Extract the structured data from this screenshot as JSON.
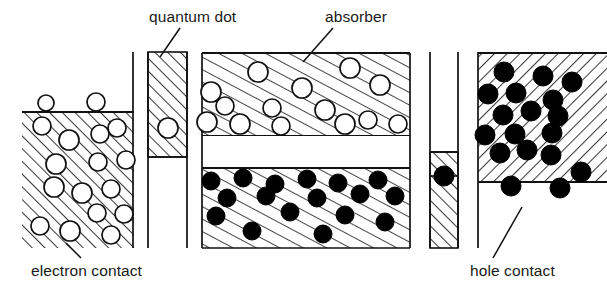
{
  "figure": {
    "kind": "semiconductor-band-diagram",
    "width": 607,
    "height": 293,
    "background_color": "#ffffff",
    "line_color": "#1a1a1a",
    "hatch_color": "#4a4a4a",
    "electron_fill": "#ffffff",
    "hole_fill": "#000000"
  },
  "labels": {
    "quantum_dot": "quantum dot",
    "absorber": "absorber",
    "electron_contact": "electron contact",
    "hole_contact": "hole contact"
  },
  "regions": [
    {
      "name": "electron-contact",
      "label": "electron contact",
      "hatch_direction": "up-right",
      "carrier": "electron",
      "carrier_symbol": "open-circle",
      "x": 22,
      "y": 112,
      "width": 112,
      "height": 136
    },
    {
      "name": "quantum-dot-barrier-left",
      "label": "quantum dot",
      "hatch_direction": "up-right",
      "carrier": "electron",
      "carrier_symbol": "open-circle",
      "x": 148,
      "y": 52,
      "width": 39,
      "height": 105
    },
    {
      "name": "absorber-conduction-band",
      "label": "absorber",
      "hatch_direction": "up-right",
      "carrier": "electron",
      "carrier_symbol": "open-circle",
      "x": 202,
      "y": 53,
      "width": 208,
      "height": 83
    },
    {
      "name": "absorber-bandgap",
      "label": "bandgap",
      "hatch_direction": "none",
      "carrier": "none",
      "x": 202,
      "y": 136,
      "width": 208,
      "height": 32
    },
    {
      "name": "absorber-valence-band",
      "label": "absorber",
      "hatch_direction": "up-right",
      "carrier": "hole",
      "carrier_symbol": "filled-circle",
      "x": 202,
      "y": 168,
      "width": 208,
      "height": 80
    },
    {
      "name": "quantum-dot-barrier-right",
      "label": "quantum dot",
      "hatch_direction": "up-right",
      "carrier": "hole",
      "carrier_symbol": "filled-circle",
      "x": 430,
      "y": 152,
      "width": 28,
      "height": 96
    },
    {
      "name": "hole-contact",
      "label": "hole contact",
      "hatch_direction": "down-right",
      "carrier": "hole",
      "carrier_symbol": "filled-circle",
      "x": 478,
      "y": 53,
      "width": 129,
      "height": 129
    }
  ],
  "carriers": {
    "electrons_free_above_contact": [
      {
        "cx": 46,
        "cy": 103,
        "r": 8
      },
      {
        "cx": 96,
        "cy": 102,
        "r": 9
      }
    ],
    "electrons_in_contact": [
      {
        "cx": 42,
        "cy": 126,
        "r": 9
      },
      {
        "cx": 69,
        "cy": 140,
        "r": 10
      },
      {
        "cx": 100,
        "cy": 134,
        "r": 9
      },
      {
        "cx": 117,
        "cy": 128,
        "r": 9
      },
      {
        "cx": 56,
        "cy": 164,
        "r": 10
      },
      {
        "cx": 98,
        "cy": 162,
        "r": 9
      },
      {
        "cx": 126,
        "cy": 160,
        "r": 9
      },
      {
        "cx": 54,
        "cy": 187,
        "r": 10
      },
      {
        "cx": 82,
        "cy": 193,
        "r": 10
      },
      {
        "cx": 111,
        "cy": 189,
        "r": 9
      },
      {
        "cx": 97,
        "cy": 213,
        "r": 9
      },
      {
        "cx": 124,
        "cy": 214,
        "r": 9
      },
      {
        "cx": 40,
        "cy": 226,
        "r": 9
      },
      {
        "cx": 70,
        "cy": 231,
        "r": 10
      },
      {
        "cx": 111,
        "cy": 235,
        "r": 9
      }
    ],
    "electron_in_quantum_dot_left": [
      {
        "cx": 168,
        "cy": 128,
        "r": 10
      }
    ],
    "electrons_in_absorber": [
      {
        "cx": 258,
        "cy": 72,
        "r": 10
      },
      {
        "cx": 350,
        "cy": 68,
        "r": 10
      },
      {
        "cx": 211,
        "cy": 92,
        "r": 10
      },
      {
        "cx": 302,
        "cy": 88,
        "r": 10
      },
      {
        "cx": 380,
        "cy": 85,
        "r": 10
      },
      {
        "cx": 225,
        "cy": 106,
        "r": 9
      },
      {
        "cx": 272,
        "cy": 108,
        "r": 9
      },
      {
        "cx": 325,
        "cy": 110,
        "r": 10
      },
      {
        "cx": 207,
        "cy": 122,
        "r": 10
      },
      {
        "cx": 240,
        "cy": 124,
        "r": 10
      },
      {
        "cx": 281,
        "cy": 126,
        "r": 9
      },
      {
        "cx": 345,
        "cy": 124,
        "r": 10
      },
      {
        "cx": 368,
        "cy": 120,
        "r": 9
      },
      {
        "cx": 398,
        "cy": 124,
        "r": 9
      }
    ],
    "holes_in_absorber": [
      {
        "cx": 211,
        "cy": 181,
        "r": 9
      },
      {
        "cx": 243,
        "cy": 178,
        "r": 9
      },
      {
        "cx": 275,
        "cy": 184,
        "r": 9
      },
      {
        "cx": 307,
        "cy": 179,
        "r": 9
      },
      {
        "cx": 338,
        "cy": 183,
        "r": 9
      },
      {
        "cx": 378,
        "cy": 180,
        "r": 9
      },
      {
        "cx": 227,
        "cy": 198,
        "r": 9
      },
      {
        "cx": 266,
        "cy": 196,
        "r": 9
      },
      {
        "cx": 317,
        "cy": 198,
        "r": 9
      },
      {
        "cx": 360,
        "cy": 194,
        "r": 9
      },
      {
        "cx": 395,
        "cy": 196,
        "r": 9
      },
      {
        "cx": 216,
        "cy": 216,
        "r": 9
      },
      {
        "cx": 290,
        "cy": 212,
        "r": 9
      },
      {
        "cx": 345,
        "cy": 215,
        "r": 9
      },
      {
        "cx": 385,
        "cy": 222,
        "r": 9
      },
      {
        "cx": 252,
        "cy": 231,
        "r": 9
      },
      {
        "cx": 323,
        "cy": 234,
        "r": 9
      }
    ],
    "hole_in_quantum_dot_right": [
      {
        "cx": 444,
        "cy": 176,
        "r": 10
      }
    ],
    "holes_in_contact": [
      {
        "cx": 504,
        "cy": 72,
        "r": 10
      },
      {
        "cx": 543,
        "cy": 76,
        "r": 10
      },
      {
        "cx": 572,
        "cy": 82,
        "r": 10
      },
      {
        "cx": 488,
        "cy": 94,
        "r": 10
      },
      {
        "cx": 516,
        "cy": 93,
        "r": 10
      },
      {
        "cx": 553,
        "cy": 100,
        "r": 10
      },
      {
        "cx": 503,
        "cy": 115,
        "r": 10
      },
      {
        "cx": 531,
        "cy": 111,
        "r": 10
      },
      {
        "cx": 558,
        "cy": 116,
        "r": 10
      },
      {
        "cx": 485,
        "cy": 135,
        "r": 10
      },
      {
        "cx": 515,
        "cy": 134,
        "r": 10
      },
      {
        "cx": 552,
        "cy": 133,
        "r": 10
      },
      {
        "cx": 500,
        "cy": 153,
        "r": 10
      },
      {
        "cx": 527,
        "cy": 150,
        "r": 10
      },
      {
        "cx": 551,
        "cy": 155,
        "r": 10
      },
      {
        "cx": 581,
        "cy": 172,
        "r": 10
      },
      {
        "cx": 511,
        "cy": 186,
        "r": 10
      },
      {
        "cx": 560,
        "cy": 188,
        "r": 10
      }
    ]
  },
  "leader_lines": [
    {
      "name": "quantum-dot-leader",
      "x1": 180,
      "y1": 28,
      "x2": 160,
      "y2": 57
    },
    {
      "name": "absorber-leader",
      "x1": 333,
      "y1": 28,
      "x2": 303,
      "y2": 62
    },
    {
      "name": "electron-contact-leader",
      "x1": 81,
      "y1": 258,
      "x2": 66,
      "y2": 243
    },
    {
      "name": "hole-contact-leader",
      "x1": 493,
      "y1": 258,
      "x2": 522,
      "y2": 207
    }
  ],
  "vertical_separators": [
    {
      "name": "left-separator",
      "x": 133,
      "y1": 52,
      "y2": 248
    },
    {
      "name": "quantum-dot-left-stem",
      "x": 148,
      "y1": 52,
      "y2": 248
    },
    {
      "name": "quantum-dot-left-stem-right",
      "x": 187,
      "y1": 52,
      "y2": 248
    },
    {
      "name": "right-separator-a",
      "x": 415,
      "y1": 52,
      "y2": 248
    },
    {
      "name": "right-separator-b",
      "x": 430,
      "y1": 52,
      "y2": 248
    },
    {
      "name": "hole-contact-left-edge",
      "x": 478,
      "y1": 52,
      "y2": 248
    }
  ]
}
